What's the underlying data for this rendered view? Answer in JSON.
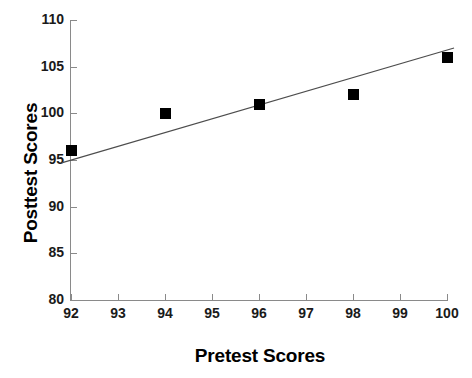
{
  "chart_data": {
    "type": "scatter",
    "title": "",
    "xlabel": "Pretest Scores",
    "ylabel": "Posttest Scores",
    "x": [
      92,
      94,
      96,
      98,
      100
    ],
    "values": [
      96,
      100,
      101,
      102,
      106
    ],
    "series": [
      {
        "name": "Observations",
        "points": [
          {
            "x": 92,
            "y": 96
          },
          {
            "x": 94,
            "y": 100
          },
          {
            "x": 96,
            "y": 101
          },
          {
            "x": 98,
            "y": 102
          },
          {
            "x": 100,
            "y": 106
          }
        ]
      }
    ],
    "trendline": {
      "type": "linear",
      "x_start": 91.8,
      "y_start": 94.7,
      "x_end": 100.15,
      "y_end": 107.0
    },
    "xlim": [
      92,
      100
    ],
    "ylim": [
      80,
      110
    ],
    "xticks": [
      92,
      93,
      94,
      95,
      96,
      97,
      98,
      99,
      100
    ],
    "yticks": [
      80,
      85,
      90,
      95,
      100,
      105,
      110
    ],
    "xticklabels": [
      "92",
      "93",
      "94",
      "95",
      "96",
      "97",
      "98",
      "99",
      "100"
    ],
    "yticklabels": [
      "80",
      "85",
      "90",
      "95",
      "100",
      "105",
      "110"
    ],
    "grid": false,
    "legend": null,
    "marker_color": "#000000",
    "line_color": "#4d4d4d",
    "axis_color": "#8a8a8a",
    "background": "#ffffff"
  }
}
